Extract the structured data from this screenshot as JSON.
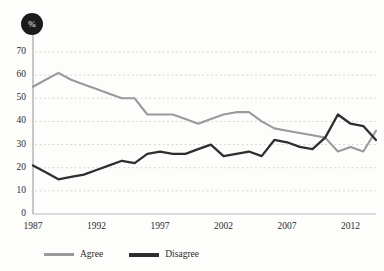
{
  "chart_data": {
    "type": "line",
    "title": "",
    "xlabel": "",
    "ylabel": "%",
    "unit_badge": "%",
    "grid": true,
    "legend_position": "bottom-left",
    "xlim": [
      1987,
      2014
    ],
    "ylim": [
      0,
      70
    ],
    "ytick_labels": [
      "0",
      "10",
      "20",
      "30",
      "40",
      "50",
      "60",
      "70"
    ],
    "yticks": [
      0,
      10,
      20,
      30,
      40,
      50,
      60,
      70
    ],
    "xtick_labels": [
      "1987",
      "1992",
      "1997",
      "2002",
      "2007",
      "2012"
    ],
    "xticks": [
      1987,
      1992,
      1997,
      2002,
      2007,
      2012
    ],
    "x": [
      1987,
      1988,
      1989,
      1990,
      1991,
      1992,
      1993,
      1994,
      1995,
      1996,
      1997,
      1998,
      1999,
      2000,
      2001,
      2002,
      2003,
      2004,
      2005,
      2006,
      2007,
      2008,
      2009,
      2010,
      2011,
      2012,
      2013,
      2014
    ],
    "series": [
      {
        "name": "Agree",
        "color": "#9a9a9a",
        "values": [
          55,
          58,
          61,
          58,
          56,
          54,
          52,
          50,
          50,
          43,
          43,
          43,
          41,
          39,
          41,
          43,
          44,
          44,
          40,
          37,
          36,
          35,
          34,
          33,
          27,
          29,
          27,
          36
        ]
      },
      {
        "name": "Disagree",
        "color": "#2e2e2e",
        "values": [
          21,
          18,
          15,
          16,
          17,
          19,
          21,
          23,
          22,
          26,
          27,
          26,
          26,
          28,
          30,
          25,
          26,
          27,
          25,
          32,
          31,
          29,
          28,
          33,
          43,
          39,
          38,
          32
        ]
      }
    ]
  },
  "legend": {
    "items": [
      {
        "label": "Agree",
        "key": "agree"
      },
      {
        "label": "Disagree",
        "key": "disagree"
      }
    ]
  }
}
